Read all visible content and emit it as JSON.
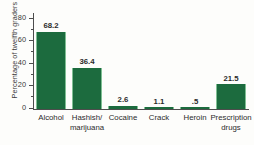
{
  "chart_data": {
    "type": "bar",
    "title": "",
    "xlabel": "",
    "ylabel": "Percentage of twelfth graders using",
    "ylim": [
      0,
      85
    ],
    "grid": false,
    "legend": false,
    "categories": [
      "Alcohol",
      "Hashish/ marijuana",
      "Cocaine",
      "Crack",
      "Heroin",
      "Prescription drugs"
    ],
    "category_lines": [
      [
        "Alcohol",
        ""
      ],
      [
        "Hashish/",
        "marijuana"
      ],
      [
        "Cocaine",
        ""
      ],
      [
        "Crack",
        ""
      ],
      [
        "Heroin",
        ""
      ],
      [
        "Prescription",
        "drugs"
      ]
    ],
    "values": [
      68.2,
      36.4,
      2.6,
      1.1,
      0.5,
      21.5
    ],
    "value_labels": [
      "68.2",
      "36.4",
      "2.6",
      "1.1",
      ".5",
      "21.5"
    ],
    "y_ticks": [
      0,
      20,
      40,
      60,
      80
    ],
    "y_tick_labels": [
      "0",
      "20",
      "40",
      "60",
      "80"
    ],
    "y_minor_ticks": [
      10,
      30,
      50,
      70
    ],
    "colors": {
      "bar": "#1c6b3e",
      "bar_edge": "#7fbf93",
      "axis": "#4d4d4d",
      "text": "#2b2b2b",
      "background": "#fdfdfb"
    }
  }
}
